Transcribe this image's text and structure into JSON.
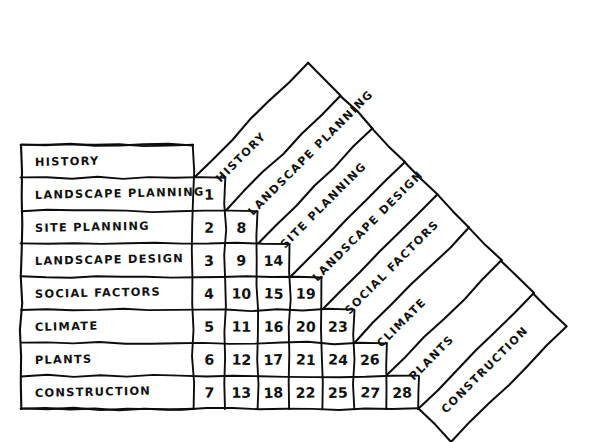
{
  "diagram": {
    "kind": "triangular-interaction-matrix",
    "title": "",
    "ink_color": "#0d0d0d",
    "background_color": "#ffffff",
    "style": "hand-drawn",
    "row_count": 8,
    "numbered_cell_count": 28,
    "row_labels": [
      "HISTORY",
      "LANDSCAPE PLANNING",
      "SITE PLANNING",
      "LANDSCAPE DESIGN",
      "SOCIAL FACTORS",
      "CLIMATE",
      "PLANTS",
      "CONSTRUCTION"
    ],
    "diagonal_labels": [
      "HISTORY",
      "LANDSCAPE PLANNING",
      "SITE PLANNING",
      "LANDSCAPE DESIGN",
      "SOCIAL FACTORS",
      "CLIMATE",
      "PLANTS",
      "CONSTRUCTION"
    ],
    "cell_rows": [
      [],
      [
        "1"
      ],
      [
        "2",
        "8"
      ],
      [
        "3",
        "9",
        "14"
      ],
      [
        "4",
        "10",
        "15",
        "19"
      ],
      [
        "5",
        "11",
        "16",
        "20",
        "23"
      ],
      [
        "6",
        "12",
        "17",
        "21",
        "24",
        "26"
      ],
      [
        "7",
        "13",
        "18",
        "22",
        "25",
        "27",
        "28"
      ]
    ]
  },
  "chart_data": {
    "type": "table",
    "categories": [
      "HISTORY",
      "LANDSCAPE PLANNING",
      "SITE PLANNING",
      "LANDSCAPE DESIGN",
      "SOCIAL FACTORS",
      "CLIMATE",
      "PLANTS",
      "CONSTRUCTION"
    ],
    "row_headers": [
      "HISTORY",
      "LANDSCAPE PLANNING",
      "SITE PLANNING",
      "LANDSCAPE DESIGN",
      "SOCIAL FACTORS",
      "CLIMATE",
      "PLANTS",
      "CONSTRUCTION"
    ],
    "column_headers": [
      "HISTORY",
      "LANDSCAPE PLANNING",
      "SITE PLANNING",
      "LANDSCAPE DESIGN",
      "SOCIAL FACTORS",
      "CLIMATE",
      "PLANTS",
      "CONSTRUCTION"
    ],
    "values": [
      [],
      [
        "1"
      ],
      [
        "2",
        "8"
      ],
      [
        "3",
        "9",
        "14"
      ],
      [
        "4",
        "10",
        "15",
        "19"
      ],
      [
        "5",
        "11",
        "16",
        "20",
        "23"
      ],
      [
        "6",
        "12",
        "17",
        "21",
        "24",
        "26"
      ],
      [
        "7",
        "13",
        "18",
        "22",
        "25",
        "27",
        "28"
      ]
    ],
    "pairings": [
      {
        "n": "1",
        "a": "LANDSCAPE PLANNING",
        "b": "HISTORY"
      },
      {
        "n": "2",
        "a": "SITE PLANNING",
        "b": "HISTORY"
      },
      {
        "n": "3",
        "a": "LANDSCAPE DESIGN",
        "b": "HISTORY"
      },
      {
        "n": "4",
        "a": "SOCIAL FACTORS",
        "b": "HISTORY"
      },
      {
        "n": "5",
        "a": "CLIMATE",
        "b": "HISTORY"
      },
      {
        "n": "6",
        "a": "PLANTS",
        "b": "HISTORY"
      },
      {
        "n": "7",
        "a": "CONSTRUCTION",
        "b": "HISTORY"
      },
      {
        "n": "8",
        "a": "SITE PLANNING",
        "b": "LANDSCAPE PLANNING"
      },
      {
        "n": "9",
        "a": "LANDSCAPE DESIGN",
        "b": "LANDSCAPE PLANNING"
      },
      {
        "n": "10",
        "a": "SOCIAL FACTORS",
        "b": "LANDSCAPE PLANNING"
      },
      {
        "n": "11",
        "a": "CLIMATE",
        "b": "LANDSCAPE PLANNING"
      },
      {
        "n": "12",
        "a": "PLANTS",
        "b": "LANDSCAPE PLANNING"
      },
      {
        "n": "13",
        "a": "CONSTRUCTION",
        "b": "LANDSCAPE PLANNING"
      },
      {
        "n": "14",
        "a": "LANDSCAPE DESIGN",
        "b": "SITE PLANNING"
      },
      {
        "n": "15",
        "a": "SOCIAL FACTORS",
        "b": "SITE PLANNING"
      },
      {
        "n": "16",
        "a": "CLIMATE",
        "b": "SITE PLANNING"
      },
      {
        "n": "17",
        "a": "PLANTS",
        "b": "SITE PLANNING"
      },
      {
        "n": "18",
        "a": "CONSTRUCTION",
        "b": "SITE PLANNING"
      },
      {
        "n": "19",
        "a": "SOCIAL FACTORS",
        "b": "LANDSCAPE DESIGN"
      },
      {
        "n": "20",
        "a": "CLIMATE",
        "b": "LANDSCAPE DESIGN"
      },
      {
        "n": "21",
        "a": "PLANTS",
        "b": "LANDSCAPE DESIGN"
      },
      {
        "n": "22",
        "a": "CONSTRUCTION",
        "b": "LANDSCAPE DESIGN"
      },
      {
        "n": "23",
        "a": "CLIMATE",
        "b": "SOCIAL FACTORS"
      },
      {
        "n": "24",
        "a": "PLANTS",
        "b": "SOCIAL FACTORS"
      },
      {
        "n": "25",
        "a": "CONSTRUCTION",
        "b": "SOCIAL FACTORS"
      },
      {
        "n": "26",
        "a": "PLANTS",
        "b": "CLIMATE"
      },
      {
        "n": "27",
        "a": "CONSTRUCTION",
        "b": "CLIMATE"
      },
      {
        "n": "28",
        "a": "CONSTRUCTION",
        "b": "PLANTS"
      }
    ],
    "xlabel": "",
    "ylabel": "",
    "grid": true,
    "legend": "none"
  }
}
